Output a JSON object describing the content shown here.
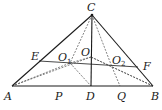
{
  "diagram": {
    "points": {
      "A": {
        "label": "A",
        "x": 12,
        "y": 86
      },
      "B": {
        "label": "B",
        "x": 153,
        "y": 86
      },
      "C": {
        "label": "C",
        "x": 92,
        "y": 15
      },
      "D": {
        "label": "D",
        "x": 91,
        "y": 86
      },
      "E": {
        "label": "E",
        "x": 39,
        "y": 61
      },
      "F": {
        "label": "F",
        "x": 138,
        "y": 67
      },
      "O": {
        "label": "O",
        "x": 91,
        "y": 57
      },
      "O1": {
        "label": "O",
        "sub": "1",
        "x": 70,
        "y": 63
      },
      "O2": {
        "label": "O",
        "sub": "2",
        "x": 112,
        "y": 67
      },
      "P": {
        "label": "P",
        "x": 58,
        "y": 86
      },
      "Q": {
        "label": "Q",
        "x": 120,
        "y": 86
      }
    },
    "segments_solid": [
      "AB",
      "BC",
      "CA",
      "CD",
      "EF"
    ],
    "segments_dashed": [
      "CO1",
      "O1D",
      "CO2",
      "CQ",
      "AO",
      "BO",
      "AO2",
      "BO1",
      "OO1",
      "OO2"
    ]
  }
}
